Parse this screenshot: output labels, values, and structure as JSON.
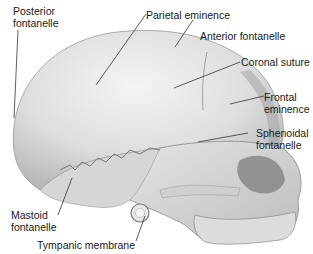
{
  "diagram": {
    "colors": {
      "bone_light": "#efefef",
      "bone_mid": "#cfcfcf",
      "bone_dark": "#8f8f8f",
      "leader_line": "#333333",
      "text": "#1a1a1a"
    },
    "labels": [
      {
        "id": "posterior-fontanelle",
        "line1": "Posterior",
        "line2": "fontanelle"
      },
      {
        "id": "parietal-eminence",
        "line1": "Parietal eminence"
      },
      {
        "id": "anterior-fontanelle",
        "line1": "Anterior fontanelle"
      },
      {
        "id": "coronal-suture",
        "line1": "Coronal suture"
      },
      {
        "id": "frontal-eminence",
        "line1": "Frontal",
        "line2": "eminence"
      },
      {
        "id": "sphenoidal-fontanelle",
        "line1": "Sphenoidal",
        "line2": "fontanelle"
      },
      {
        "id": "mastoid-fontanelle",
        "line1": "Mastoid",
        "line2": "fontanelle"
      },
      {
        "id": "tympanic-membrane",
        "line1": "Tympanic membrane"
      }
    ]
  }
}
